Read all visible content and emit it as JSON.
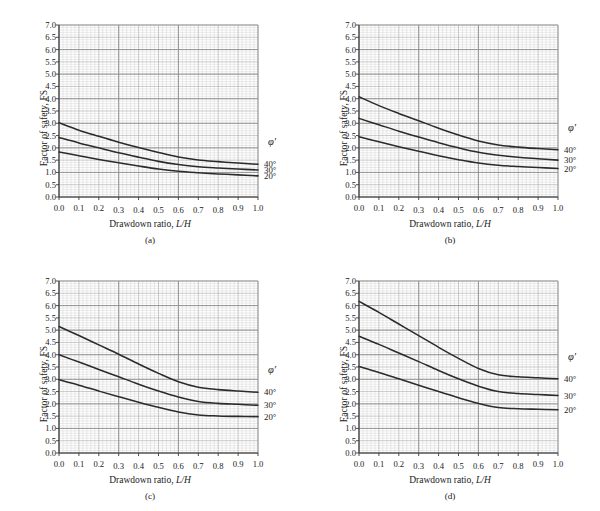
{
  "figure": {
    "axis_y_label": "Factor of safety, FS",
    "axis_x_label_plain": "Drawdown ratio, ",
    "axis_x_label_italic": "L/H",
    "legend_title": "φ′",
    "curve_color": "#2b2b2b",
    "grid_minor_color": "#c9c9c9",
    "grid_major_color": "#8d8d8d",
    "axis_color": "#3a3a3a",
    "background": "#ffffff",
    "yticks": [
      "0.0",
      "0.5",
      "1.0",
      "1.5",
      "2.0",
      "2.5",
      "3.0",
      "3.5",
      "4.0",
      "4.5",
      "5.0",
      "5.5",
      "6.0",
      "6.5",
      "7.0"
    ],
    "xticks": [
      "0.0",
      "0.1",
      "0.2",
      "0.3",
      "0.4",
      "0.5",
      "0.6",
      "0.7",
      "0.8",
      "0.9",
      "1.0"
    ]
  },
  "chart_data": [
    {
      "type": "line",
      "panel": "(a)",
      "title": "",
      "xlabel": "Drawdown ratio, L/H",
      "ylabel": "Factor of safety, FS",
      "xlim": [
        0.0,
        1.0
      ],
      "ylim": [
        0.0,
        7.0
      ],
      "grid": true,
      "legend_position": "right-outside",
      "legend_title": "φ′",
      "x": [
        0.0,
        0.1,
        0.2,
        0.3,
        0.4,
        0.5,
        0.6,
        0.7,
        0.8,
        0.9,
        1.0
      ],
      "series": [
        {
          "name": "40°",
          "values": [
            3.02,
            2.72,
            2.47,
            2.23,
            2.01,
            1.81,
            1.63,
            1.51,
            1.44,
            1.38,
            1.33
          ]
        },
        {
          "name": "30°",
          "values": [
            2.42,
            2.2,
            2.0,
            1.8,
            1.62,
            1.45,
            1.32,
            1.23,
            1.18,
            1.14,
            1.1
          ]
        },
        {
          "name": "20°",
          "values": [
            1.83,
            1.68,
            1.53,
            1.39,
            1.26,
            1.14,
            1.05,
            0.99,
            0.94,
            0.9,
            0.86
          ]
        }
      ]
    },
    {
      "type": "line",
      "panel": "(b)",
      "title": "",
      "xlabel": "Drawdown ratio, L/H",
      "ylabel": "Factor of safety, FS",
      "xlim": [
        0.0,
        1.0
      ],
      "ylim": [
        0.0,
        7.0
      ],
      "grid": true,
      "legend_position": "right-outside",
      "legend_title": "φ′",
      "x": [
        0.0,
        0.1,
        0.2,
        0.3,
        0.4,
        0.5,
        0.6,
        0.7,
        0.8,
        0.9,
        1.0
      ],
      "series": [
        {
          "name": "40°",
          "values": [
            4.08,
            3.72,
            3.4,
            3.1,
            2.8,
            2.52,
            2.28,
            2.12,
            2.03,
            1.97,
            1.92
          ]
        },
        {
          "name": "30°",
          "values": [
            3.2,
            2.94,
            2.68,
            2.44,
            2.21,
            2.0,
            1.82,
            1.7,
            1.62,
            1.56,
            1.5
          ]
        },
        {
          "name": "20°",
          "values": [
            2.45,
            2.25,
            2.05,
            1.86,
            1.68,
            1.52,
            1.38,
            1.29,
            1.24,
            1.2,
            1.16
          ]
        }
      ]
    },
    {
      "type": "line",
      "panel": "(c)",
      "title": "",
      "xlabel": "Drawdown ratio, L/H",
      "ylabel": "Factor of safety, FS",
      "xlim": [
        0.0,
        1.0
      ],
      "ylim": [
        0.0,
        7.0
      ],
      "grid": true,
      "legend_position": "right-outside",
      "legend_title": "φ′",
      "x": [
        0.0,
        0.1,
        0.2,
        0.3,
        0.4,
        0.5,
        0.6,
        0.7,
        0.8,
        0.9,
        1.0
      ],
      "series": [
        {
          "name": "40°",
          "values": [
            5.15,
            4.78,
            4.4,
            4.02,
            3.62,
            3.24,
            2.9,
            2.68,
            2.58,
            2.52,
            2.47
          ]
        },
        {
          "name": "30°",
          "values": [
            4.0,
            3.7,
            3.4,
            3.1,
            2.8,
            2.52,
            2.28,
            2.1,
            2.02,
            1.98,
            1.94
          ]
        },
        {
          "name": "20°",
          "values": [
            2.98,
            2.76,
            2.52,
            2.29,
            2.07,
            1.86,
            1.67,
            1.55,
            1.51,
            1.49,
            1.48
          ]
        }
      ]
    },
    {
      "type": "line",
      "panel": "(d)",
      "title": "",
      "xlabel": "Drawdown ratio, L/H",
      "ylabel": "Factor of safety, FS",
      "xlim": [
        0.0,
        1.0
      ],
      "ylim": [
        0.0,
        7.0
      ],
      "grid": true,
      "legend_position": "right-outside",
      "legend_title": "φ′",
      "x": [
        0.0,
        0.1,
        0.2,
        0.3,
        0.4,
        0.5,
        0.6,
        0.7,
        0.8,
        0.9,
        1.0
      ],
      "series": [
        {
          "name": "40°",
          "values": [
            6.17,
            5.72,
            5.25,
            4.78,
            4.3,
            3.85,
            3.44,
            3.18,
            3.1,
            3.06,
            3.02
          ]
        },
        {
          "name": "30°",
          "values": [
            4.75,
            4.42,
            4.07,
            3.72,
            3.36,
            3.02,
            2.72,
            2.5,
            2.42,
            2.38,
            2.34
          ]
        },
        {
          "name": "20°",
          "values": [
            3.52,
            3.28,
            3.02,
            2.76,
            2.5,
            2.25,
            2.02,
            1.85,
            1.8,
            1.78,
            1.76
          ]
        }
      ]
    }
  ]
}
